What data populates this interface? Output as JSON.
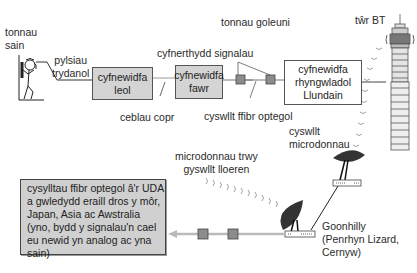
{
  "diagram": {
    "labels": {
      "sound_waves": [
        "tonnau",
        "sain"
      ],
      "electric_pulses": [
        "pylsiau",
        "trydanol"
      ],
      "copper_cables": "ceblau copr",
      "signal_boosters": "cyfnerthydd signalau",
      "light_waves": "tonnau goleuni",
      "optical_fibre_link": "cyswllt ffibr optegol",
      "bt_tower": "tŵr BT",
      "microwave_link": [
        "cyswllt",
        "microdonnau"
      ],
      "satellite_microwaves": [
        "microdonnau trwy",
        "gyswllt lloeren"
      ],
      "goonhilly": [
        "Goonhilly",
        "(Penrhyn Lizard,",
        "Cernyw)"
      ]
    },
    "boxes": {
      "local_exchange": [
        "cyfnewidfa",
        "leol"
      ],
      "main_exchange": [
        "cyfnewidfa",
        "fawr"
      ],
      "international_exchange": [
        "cyfnewidfa",
        "rhyngwladol",
        "Llundain"
      ],
      "overseas": [
        "cysylltau ffibr optegol â'r UDA",
        "a gwledydd eraill dros y môr,",
        "Japan, Asia ac Awstralia",
        "(yno, bydd y signalau'n cael",
        "eu newid yn analog ac yna",
        "sain)"
      ]
    },
    "colors": {
      "box_fill": "#d4d4d4",
      "booster_fill": "#8c8c8c",
      "arrow_grey": "#bbbbbb",
      "line": "#444444"
    },
    "icons": [
      "person-on-phone-icon",
      "bt-tower-icon",
      "satellite-dish-icon",
      "microwave-dish-icon",
      "signal-booster-icon"
    ]
  }
}
